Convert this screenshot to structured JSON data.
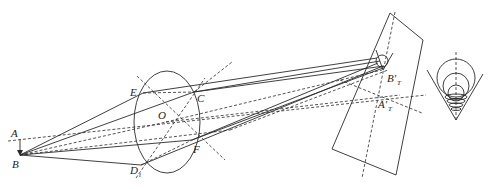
{
  "diagram": {
    "type": "optical-ray-diagram",
    "labels": {
      "A": "A",
      "B": "B",
      "E": "E",
      "C": "C",
      "O": "O",
      "F": "F",
      "D": "D",
      "D_sub": "i",
      "B_image": "B′",
      "B_image_sub": "T",
      "A_image": "A′",
      "A_image_sub": "T"
    },
    "elements": [
      "object-arrow-AB",
      "lens-ellipse",
      "image-plane-rectangle",
      "blur-circle",
      "defocus-cone-inset"
    ],
    "colors": {
      "line": "#2a2a2a",
      "background": "#ffffff"
    }
  }
}
